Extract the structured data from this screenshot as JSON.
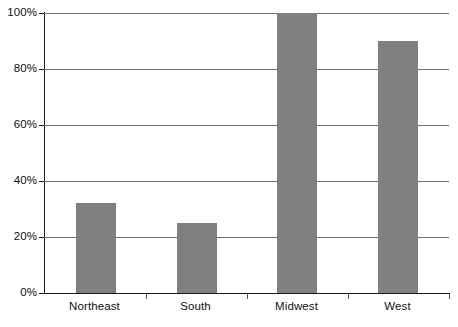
{
  "chart_data": {
    "type": "bar",
    "title": "",
    "subtitle": "",
    "xlabel": "",
    "ylabel": "",
    "categories": [
      "Northeast",
      "South",
      "Midwest",
      "West"
    ],
    "values": [
      32,
      25,
      100,
      90
    ],
    "value_labels": [
      "32%",
      "25%",
      "100%",
      "90%"
    ],
    "ylim": [
      0,
      100
    ],
    "y_ticks": [
      0,
      20,
      40,
      60,
      80,
      100
    ],
    "y_tick_labels": [
      "0%",
      "20%",
      "40%",
      "60%",
      "80%",
      "100%"
    ],
    "grid": true,
    "grid_axis": "y",
    "legend": false,
    "legend_position": "none",
    "series": [
      {
        "name": "",
        "values": [
          32,
          25,
          100,
          90
        ]
      }
    ],
    "colors": {
      "bar_fill": "#808080",
      "gridline": "#6e6e6e",
      "axis": "#1a1a1a",
      "background": "#ffffff",
      "tick_text": "#111111"
    }
  }
}
